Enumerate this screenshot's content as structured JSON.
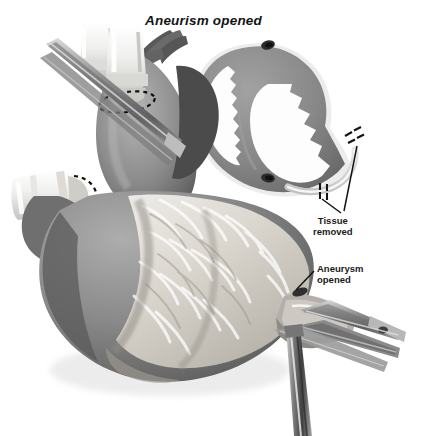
{
  "figure": {
    "title": "Aneurism opened",
    "background_color": "#ffffff",
    "width": 444,
    "height": 436,
    "rendering": "grayscale-airbrush-medical-illustration"
  },
  "callouts": {
    "tissue_removed": {
      "line1": "Tissue",
      "line2": "removed"
    },
    "aneurysm_opened": {
      "line1": "Aneurysm",
      "line2": "opened"
    }
  },
  "palette": {
    "background": "#ffffff",
    "ink": "#1a1a1a",
    "myocardium_dark": "#6e6e6e",
    "myocardium_mid": "#8c8c8c",
    "myocardium_light": "#a8a8a8",
    "epicardial_fat": "#e8e6e1",
    "cannula_white": "#f4f4f2",
    "instrument_steel": "#9a9a9a",
    "instrument_shadow": "#4f4f4f",
    "lumen_white": "#fdfdfd",
    "vessel_dark": "#3a3a3a"
  },
  "inset": {
    "name": "ventricular-cross-section",
    "description": "cross-section of ventricles showing thickened gray myocardial wall, white chamber lumens, dark papillary-muscle spots and pale aneurysmal tissue band marked with dashed cut lines"
  },
  "main_illustration": {
    "name": "opened-heart-with-instruments",
    "parts": [
      "aorta-with-cannula",
      "aortic-purse-string-suture",
      "venous-cannula-left",
      "venous-purse-string-suture",
      "cross-clamp-instrument",
      "epicardial-fat-and-coronary-vessels",
      "left-ventricle-body",
      "opened-aneurysm-sac",
      "forceps-grasping-aneurysm",
      "hemostat-lower",
      "vertical-instrument-shaft"
    ]
  }
}
